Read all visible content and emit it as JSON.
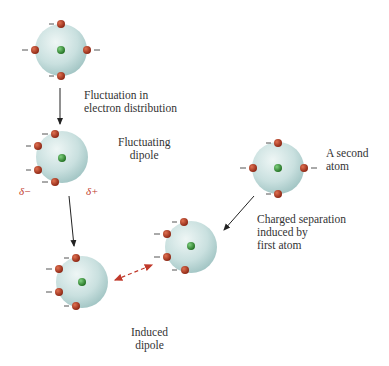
{
  "labels": {
    "fluctuation": "Fluctuation in\nelectron distribution",
    "fluctuating_dipole": "Fluctuating\ndipole",
    "second_atom": "A second\natom",
    "charged_separation": "Charged separation\ninduced by\nfirst atom",
    "induced_dipole": "Induced\ndipole",
    "delta_minus": "δ−",
    "delta_plus": "δ+"
  },
  "colors": {
    "atom_body": "#c9e0df",
    "electron": "#a8321c",
    "nucleus": "#2e8b2e",
    "arrow": "#222222",
    "interaction_arrow": "#c0392b"
  }
}
